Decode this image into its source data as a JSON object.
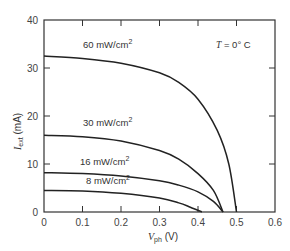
{
  "chart_data": {
    "type": "line",
    "title": "",
    "annotation": "T = 0° C",
    "xlabel": "V_ph (V)",
    "ylabel": "I_ext (mA)",
    "xlim": [
      0,
      0.6
    ],
    "ylim": [
      0,
      40
    ],
    "x_ticks": [
      "0",
      "0.1",
      "0.2",
      "0.3",
      "0.4",
      "0.5",
      "0.6"
    ],
    "y_ticks": [
      "0",
      "10",
      "20",
      "30",
      "40"
    ],
    "grid": false,
    "series": [
      {
        "name": "60 mW/cm2",
        "x": [
          0,
          0.1,
          0.2,
          0.3,
          0.35,
          0.4,
          0.45,
          0.48,
          0.5
        ],
        "values": [
          32.5,
          32.0,
          31.0,
          29.0,
          27.0,
          23.5,
          17.0,
          10.0,
          0
        ]
      },
      {
        "name": "30 mW/cm2",
        "x": [
          0,
          0.1,
          0.2,
          0.3,
          0.35,
          0.4,
          0.44,
          0.465
        ],
        "values": [
          16.0,
          15.7,
          14.8,
          12.8,
          11.0,
          8.0,
          4.5,
          0
        ]
      },
      {
        "name": "16 mW/cm2",
        "x": [
          0,
          0.1,
          0.2,
          0.3,
          0.35,
          0.4,
          0.44,
          0.465
        ],
        "values": [
          8.2,
          8.0,
          7.5,
          6.5,
          5.6,
          4.2,
          2.2,
          0
        ]
      },
      {
        "name": "8 mW/cm2",
        "x": [
          0,
          0.1,
          0.2,
          0.3,
          0.35,
          0.38,
          0.41
        ],
        "values": [
          4.5,
          4.4,
          3.9,
          2.9,
          1.9,
          1.0,
          0
        ]
      }
    ]
  },
  "labels": {
    "annotation_T": "T",
    "annotation_rest": " = 0° C",
    "xlabel_main": "V",
    "xlabel_sub": "ph",
    "xlabel_unit": " (V)",
    "ylabel_main": "I",
    "ylabel_sub": "ext",
    "ylabel_unit": " (mA)",
    "curve_60": "60 mW/cm",
    "curve_30": "30 mW/cm",
    "curve_16": "16 mW/cm",
    "curve_8": "8 mW/cm",
    "sup": "2"
  }
}
